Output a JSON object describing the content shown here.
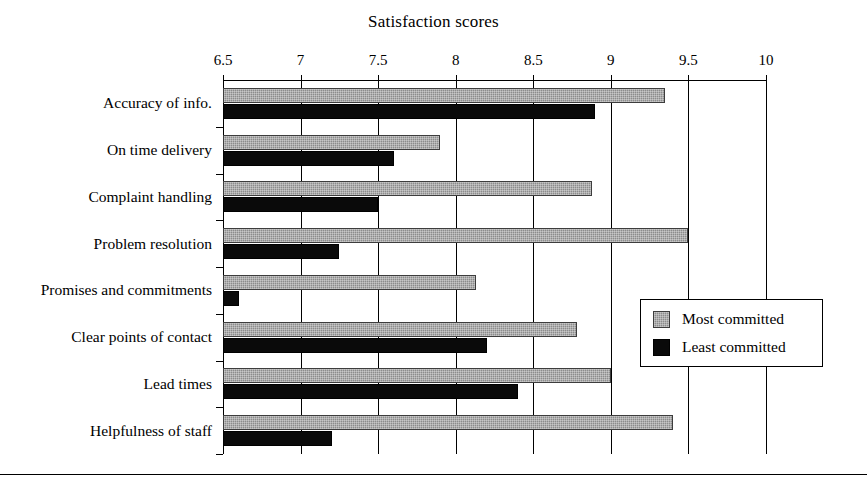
{
  "chart_data": {
    "type": "bar",
    "orientation": "horizontal",
    "title": "Satisfaction scores",
    "xlabel": "",
    "ylabel": "",
    "xlim": [
      6.5,
      10
    ],
    "xticks": [
      6.5,
      7,
      7.5,
      8,
      8.5,
      9,
      9.5,
      10
    ],
    "xtick_labels": [
      "6.5",
      "7",
      "7.5",
      "8",
      "8.5",
      "9",
      "9.5",
      "10"
    ],
    "grid": true,
    "grid_axis": "x",
    "legend_position": "lower-right",
    "categories": [
      "Accuracy of info.",
      "On time delivery",
      "Complaint handling",
      "Problem resolution",
      "Promises and commitments",
      "Clear points of contact",
      "Lead times",
      "Helpfulness of staff"
    ],
    "series": [
      {
        "name": "Most committed",
        "color": "#8c8c8c",
        "values": [
          9.35,
          7.9,
          8.88,
          9.5,
          8.13,
          8.78,
          9.0,
          9.4
        ]
      },
      {
        "name": "Least committed",
        "color": "#000000",
        "values": [
          8.9,
          7.6,
          7.5,
          7.25,
          6.6,
          8.2,
          8.4,
          7.2
        ]
      }
    ]
  },
  "legend": {
    "entries": [
      {
        "label": "Most committed",
        "swatch": "most"
      },
      {
        "label": "Least committed",
        "swatch": "least"
      }
    ]
  }
}
